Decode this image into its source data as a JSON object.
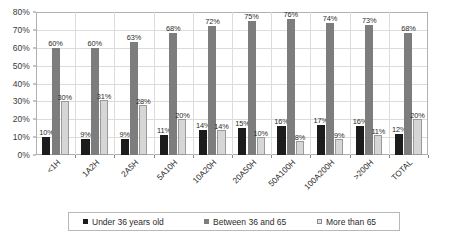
{
  "chart_data": {
    "type": "bar",
    "title": "",
    "subtitle": "",
    "xlabel": "",
    "ylabel": "",
    "ylim": [
      0,
      80
    ],
    "ytick_labels": [
      "0%",
      "10%",
      "20%",
      "30%",
      "40%",
      "50%",
      "60%",
      "70%",
      "80%"
    ],
    "ytick_values": [
      0,
      10,
      20,
      30,
      40,
      50,
      60,
      70,
      80
    ],
    "grid": true,
    "legend_position": "bottom",
    "value_suffix": "%",
    "categories": [
      "<1H",
      "1A2H",
      "2A5H",
      "5A10H",
      "10A20H",
      "20A50H",
      "50A100H",
      "100A200H",
      ">200H",
      "TOTAL"
    ],
    "series": [
      {
        "name": "Under 36 years old",
        "color": "#1c1c1c",
        "values": [
          10,
          9,
          9,
          11,
          14,
          15,
          16,
          17,
          16,
          12
        ],
        "labels": [
          "10%",
          "9%",
          "9%",
          "11%",
          "14%",
          "15%",
          "16%",
          "17%",
          "16%",
          "12%"
        ]
      },
      {
        "name": "Between 36 and 65",
        "color": "#7d7d7d",
        "values": [
          60,
          60,
          63,
          68,
          72,
          75,
          76,
          74,
          73,
          68
        ],
        "labels": [
          "60%",
          "60%",
          "63%",
          "68%",
          "72%",
          "75%",
          "76%",
          "74%",
          "73%",
          "68%"
        ]
      },
      {
        "name": "More than 65",
        "color": "#d6d6d6",
        "values": [
          30,
          31,
          28,
          20,
          14,
          10,
          8,
          9,
          11,
          20
        ],
        "labels": [
          "30%",
          "31%",
          "28%",
          "20%",
          "14%",
          "10%",
          "8%",
          "9%",
          "11%",
          "20%"
        ]
      }
    ]
  }
}
